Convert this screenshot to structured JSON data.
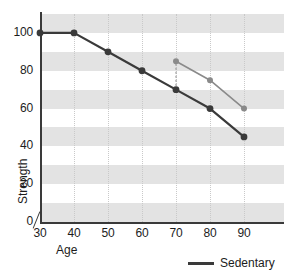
{
  "chart_data": {
    "type": "line",
    "title": "",
    "xlabel": "Age",
    "ylabel": "Strength",
    "xlim": [
      30,
      90
    ],
    "ylim": [
      0,
      110
    ],
    "xticks": [
      30,
      40,
      50,
      60,
      70,
      80,
      90
    ],
    "yticks": [
      0,
      20,
      40,
      60,
      80,
      100
    ],
    "grid": "dotted-vertical-gridlines-with-alternating-horizontal-gray-bands",
    "axis_break": "y-axis break between 0 and 30 on x-axis",
    "legend_position": "bottom-right",
    "series": [
      {
        "name": "Sedentary",
        "color": "#3a3a3a",
        "x": [
          30,
          40,
          50,
          60,
          70,
          80,
          90
        ],
        "values": [
          100,
          100,
          90,
          80,
          70,
          60,
          45
        ]
      },
      {
        "name": "",
        "color": "#8a8a8a",
        "x": [
          70,
          80,
          90
        ],
        "values": [
          85,
          75,
          60
        ]
      }
    ],
    "connector": {
      "x": 70,
      "from": 70,
      "to": 85,
      "style": "dotted"
    }
  },
  "legend": {
    "entries": [
      {
        "label": "Sedentary",
        "color": "#3a3a3a"
      }
    ]
  },
  "axis_labels": {
    "y_title": "Strength",
    "x_title": "Age",
    "y_ticks": [
      "100",
      "80",
      "60",
      "40",
      "20",
      "0"
    ],
    "x_ticks": [
      "30",
      "40",
      "50",
      "60",
      "70",
      "80",
      "90"
    ]
  }
}
